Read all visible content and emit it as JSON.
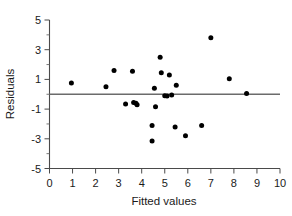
{
  "chart_data": {
    "type": "scatter",
    "title": "",
    "xlabel": "Fitted values",
    "ylabel": "Residuals",
    "xlim": [
      0,
      10
    ],
    "ylim": [
      -5,
      5
    ],
    "grid": false,
    "legend": null,
    "xticks": [
      0,
      1,
      2,
      3,
      4,
      5,
      6,
      7,
      8,
      9,
      10
    ],
    "xtick_labels": [
      "0",
      "1",
      "2",
      "3",
      "4",
      "5",
      "6",
      "7",
      "8",
      "9",
      "10"
    ],
    "yticks": [
      -5,
      -3,
      -1,
      1,
      3,
      5
    ],
    "ytick_labels": [
      "-5",
      "-3",
      "-1",
      "1",
      "3",
      "5"
    ],
    "yticks_minor": [
      -4,
      -2,
      0,
      2,
      4
    ],
    "reference_line": {
      "orientation": "horizontal",
      "y": 0,
      "color": "#6b6b6b"
    },
    "marker": {
      "shape": "circle",
      "color": "#000000",
      "size_px": 5.0
    },
    "points": [
      {
        "x": 0.95,
        "y": 0.75
      },
      {
        "x": 2.45,
        "y": 0.5
      },
      {
        "x": 2.8,
        "y": 1.6
      },
      {
        "x": 3.3,
        "y": -0.65
      },
      {
        "x": 3.6,
        "y": 1.55
      },
      {
        "x": 3.65,
        "y": -0.55
      },
      {
        "x": 3.75,
        "y": -0.6
      },
      {
        "x": 3.8,
        "y": -0.7
      },
      {
        "x": 4.45,
        "y": -3.15
      },
      {
        "x": 4.45,
        "y": -2.1
      },
      {
        "x": 4.55,
        "y": 0.4
      },
      {
        "x": 4.6,
        "y": -0.85
      },
      {
        "x": 4.8,
        "y": 2.5
      },
      {
        "x": 4.85,
        "y": 1.45
      },
      {
        "x": 5.0,
        "y": -0.1
      },
      {
        "x": 5.1,
        "y": -0.12
      },
      {
        "x": 5.2,
        "y": 1.3
      },
      {
        "x": 5.3,
        "y": -0.05
      },
      {
        "x": 5.45,
        "y": -2.2
      },
      {
        "x": 5.5,
        "y": 0.6
      },
      {
        "x": 5.9,
        "y": -2.8
      },
      {
        "x": 6.6,
        "y": -2.1
      },
      {
        "x": 7.0,
        "y": 3.8
      },
      {
        "x": 7.8,
        "y": 1.05
      },
      {
        "x": 8.55,
        "y": 0.05
      }
    ]
  },
  "axes": {
    "x_axis_name": "fitted-values-axis",
    "y_axis_name": "residuals-axis"
  }
}
